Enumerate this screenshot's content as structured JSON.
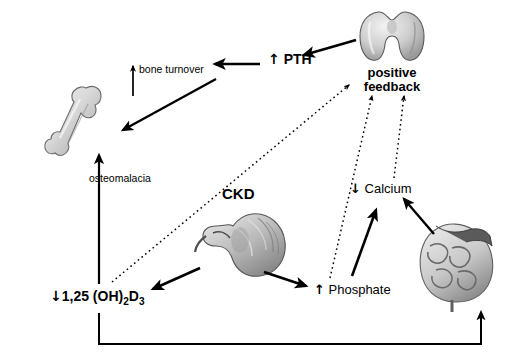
{
  "figure": {
    "type": "pathophysiology-flow-diagram",
    "background": "#ffffff",
    "line_color": "#000000"
  },
  "labels": {
    "pth": "PTH",
    "pth_direction": "up",
    "positive_feedback": "positive feedback",
    "bone_turnover": "bone turnover",
    "bone_turnover_direction": "up",
    "osteomalacia": "osteomalacia",
    "ckd": "CKD",
    "calcium": "Calcium",
    "calcium_direction": "down",
    "phosphate": "Phosphate",
    "phosphate_direction": "up",
    "vitamin_d": "1,25 (OH)",
    "vitamin_d_sub": "2",
    "vitamin_d_tail": "D",
    "vitamin_d_sub2": "3",
    "vitamin_d_direction": "down"
  },
  "organs": [
    {
      "name": "thyroid-parathyroid-gland",
      "label": "",
      "x": 370,
      "y": 10
    },
    {
      "name": "long-bone",
      "label": "",
      "x": 75,
      "y": 85
    },
    {
      "name": "kidney",
      "label": "",
      "x": 200,
      "y": 212
    },
    {
      "name": "intestine",
      "label": "",
      "x": 440,
      "y": 225
    }
  ],
  "arrows": [
    {
      "name": "gland-to-pth",
      "style": "solid"
    },
    {
      "name": "pth-to-bone-turnover",
      "style": "solid"
    },
    {
      "name": "bone-turnover-up",
      "style": "solid"
    },
    {
      "name": "vitd-to-osteomalacia-bone",
      "style": "solid"
    },
    {
      "name": "vitd-to-positive-feedback",
      "style": "dotted"
    },
    {
      "name": "phosphate-to-positive-feedback",
      "style": "dotted"
    },
    {
      "name": "calcium-to-positive-feedback",
      "style": "dotted"
    },
    {
      "name": "ckd-kidney-to-vitd",
      "style": "solid"
    },
    {
      "name": "ckd-kidney-to-phosphate",
      "style": "solid"
    },
    {
      "name": "phosphate-to-calcium",
      "style": "solid"
    },
    {
      "name": "intestine-to-calcium",
      "style": "solid"
    },
    {
      "name": "vitd-to-intestine-bottom-loop",
      "style": "solid"
    }
  ]
}
